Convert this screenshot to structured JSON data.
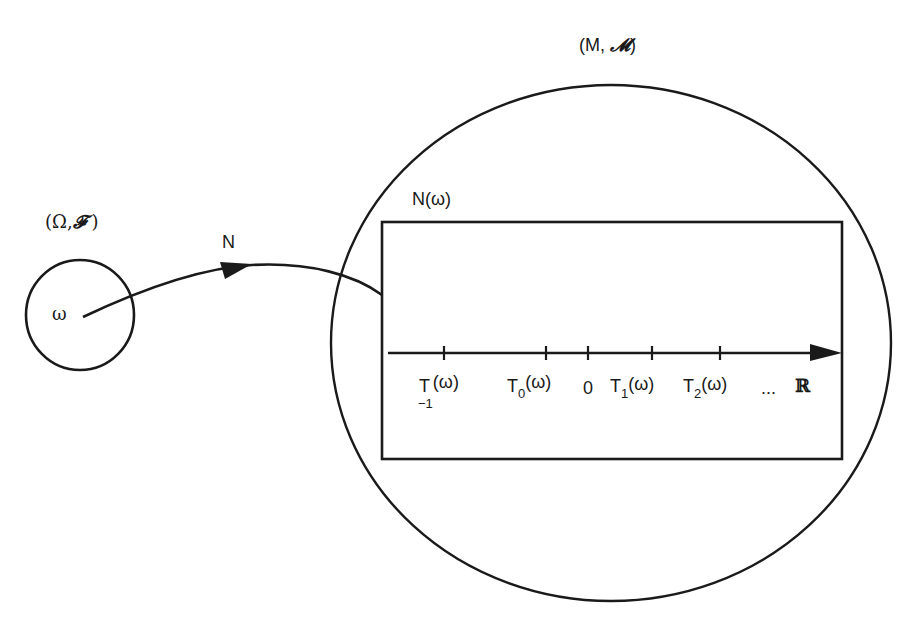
{
  "diagram": {
    "colors": {
      "stroke": "#1a1a1a",
      "background": "#ffffff"
    },
    "measurable_space_omega": {
      "label_open": "(",
      "omega_symbol": "Ω",
      "sep": ",",
      "sigma_symbol": "𝓕",
      "label_close": ")",
      "point_label": "ω"
    },
    "measurable_space_m": {
      "label_open": "(",
      "m_symbol": "M",
      "sep": ",",
      "sigma_symbol": "𝓜",
      "label_close": ")"
    },
    "mapping": {
      "label": "N"
    },
    "image_box": {
      "label": "N(ω)"
    },
    "real_line": {
      "axis_label": "ℝ",
      "ellipsis": "...",
      "ticks": [
        {
          "base": "T",
          "sub": "−1",
          "arg": "(ω)"
        },
        {
          "base": "T",
          "sub": "0",
          "arg": "(ω)"
        },
        {
          "base": "",
          "sub": "",
          "arg": "0"
        },
        {
          "base": "T",
          "sub": "1",
          "arg": "(ω)"
        },
        {
          "base": "T",
          "sub": "2",
          "arg": "(ω)"
        }
      ]
    }
  }
}
